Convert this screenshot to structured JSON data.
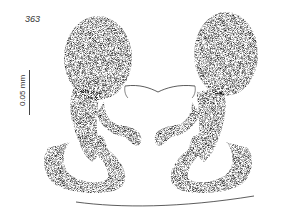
{
  "figure": {
    "number": "363",
    "scale_bar": {
      "label": "0.05 mm"
    },
    "colors": {
      "ink": "#333333",
      "stipple_light": "#bdbdbd",
      "stipple_dark": "#5a5a5a",
      "background": "#ffffff"
    }
  }
}
